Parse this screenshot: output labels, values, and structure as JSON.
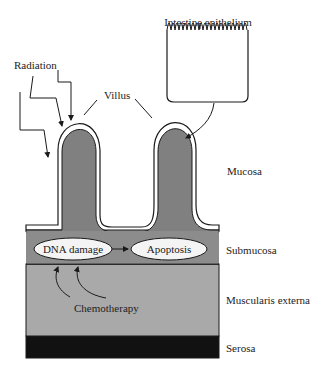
{
  "diagram": {
    "labels": {
      "intestine_epithelium": "Intestine epithelium",
      "radiation": "Radiation",
      "villus": "Villus",
      "mucosa": "Mucosa",
      "submucosa": "Submucosa",
      "muscularis_externa": "Muscularis externa",
      "serosa": "Serosa",
      "chemotherapy": "Chemotherapy"
    },
    "process": {
      "step1": "DNA damage",
      "step2": "Apoptosis"
    },
    "colors": {
      "villus_fill": "#808080",
      "submucosa_fill": "#8c8c8c",
      "muscularis_fill": "#a9a9a9",
      "serosa_fill": "#111111",
      "outline": "#1a1a1a",
      "ellipse_fill": "#f4f4f4"
    }
  }
}
